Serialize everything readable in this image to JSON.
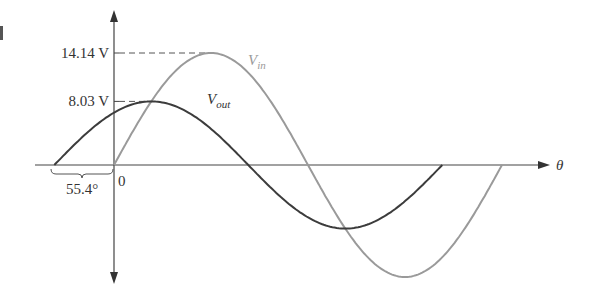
{
  "chart_data": {
    "type": "line",
    "title": "",
    "xlabel": "θ",
    "ylabel": "",
    "grid": false,
    "x_unit": "degrees",
    "origin_label": "0",
    "phase_shift_label": "55.4°",
    "phase_shift_deg": 55.4,
    "y_ticks": [
      {
        "value": 14.14,
        "label": "14.14 V"
      },
      {
        "value": 8.03,
        "label": "8.03 V"
      }
    ],
    "series": [
      {
        "name": "Vin",
        "label_main": "V",
        "label_sub": "in",
        "amplitude": 14.14,
        "phase_deg": 0,
        "x_start_deg": 0,
        "x_end_deg": 360,
        "color": "#9a9a9a",
        "x": [
          0,
          45,
          90,
          135,
          180,
          225,
          270,
          315,
          360
        ],
        "values": [
          0,
          10.0,
          14.14,
          10.0,
          0,
          -10.0,
          -14.14,
          -10.0,
          0
        ]
      },
      {
        "name": "Vout",
        "label_main": "V",
        "label_sub": "out",
        "amplitude": 8.03,
        "phase_deg": 55.4,
        "x_start_deg": -55.4,
        "x_end_deg": 304.6,
        "color": "#3c3c3c",
        "x": [
          -55.4,
          0,
          34.6,
          124.6,
          214.6,
          304.6
        ],
        "values": [
          0,
          6.61,
          8.03,
          0,
          -8.03,
          0
        ]
      }
    ]
  }
}
